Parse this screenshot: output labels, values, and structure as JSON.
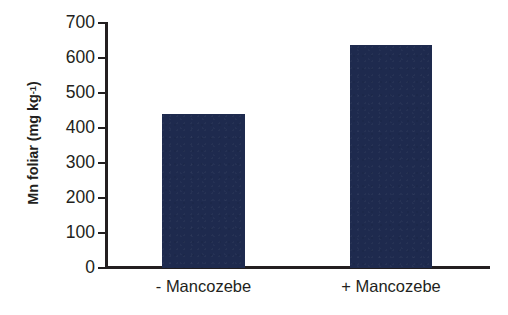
{
  "chart_data": {
    "type": "bar",
    "title": "",
    "subtitle": "",
    "xlabel": "",
    "ylabel": "Mn foliar (mg kg-1)",
    "ylabel_main": "Mn foliar (mg kg",
    "ylabel_sup": "-1",
    "ylabel_tail": ")",
    "categories": [
      "- Mancozebe",
      "+ Mancozebe"
    ],
    "values": [
      440,
      637
    ],
    "ylim": [
      0,
      700
    ],
    "ytick_labels": [
      "0",
      "100",
      "200",
      "300",
      "400",
      "500",
      "600",
      "700"
    ],
    "ytick_values": [
      0,
      100,
      200,
      300,
      400,
      500,
      600,
      700
    ],
    "grid": false,
    "legend": false,
    "legend_position": "none",
    "bar_color": "#1e2a4e",
    "axis_color": "#231f20",
    "background_color": "#ffffff",
    "series": [
      {
        "name": "Mn foliar",
        "values": [
          440,
          637
        ]
      }
    ]
  }
}
